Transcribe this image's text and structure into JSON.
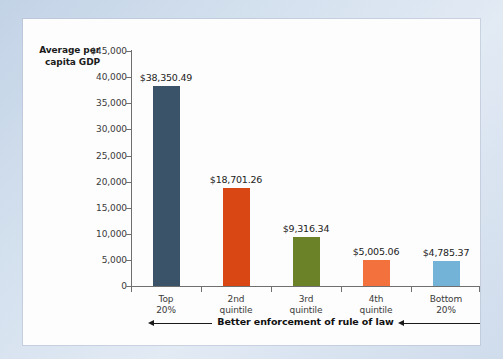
{
  "chart_data": {
    "type": "bar",
    "title": "",
    "ylabel": "Average per capita GDP",
    "xlabel": "",
    "categories": [
      "Top 20%",
      "2nd quintile",
      "3rd quintile",
      "4th quintile",
      "Bottom 20%"
    ],
    "category_lines": [
      [
        "Top",
        "20%"
      ],
      [
        "2nd",
        "quintile"
      ],
      [
        "3rd",
        "quintile"
      ],
      [
        "4th",
        "quintile"
      ],
      [
        "Bottom",
        "20%"
      ]
    ],
    "values": [
      38350.49,
      18701.26,
      9316.34,
      5005.06,
      4785.37
    ],
    "value_labels": [
      "$38,350.49",
      "$18,701.26",
      "$9,316.34",
      "$5,005.06",
      "$4,785.37"
    ],
    "bar_colors": [
      "#3a5368",
      "#d94715",
      "#6b8228",
      "#f2713d",
      "#74b3d8"
    ],
    "ylim": [
      0,
      45000
    ],
    "ytick_values": [
      45000,
      40000,
      35000,
      30000,
      25000,
      20000,
      15000,
      10000,
      5000,
      0
    ],
    "ytick_labels": [
      "$45,000",
      "40,000",
      "35,000",
      "30,000",
      "25,000",
      "20,000",
      "15,000",
      "10,000",
      "5,000",
      "0"
    ],
    "grid": false,
    "legend": "none",
    "annotation": {
      "text": "Better enforcement of rule of law",
      "direction": "left",
      "arrow_count": 2
    }
  },
  "axis": {
    "y_title_line1": "Average per",
    "y_title_line2": "capita GDP"
  },
  "colors": {
    "page_background": "#cfdcec",
    "panel_background": "#fdfdfd",
    "axis_line": "#6f6f6f",
    "text": "#222222"
  }
}
